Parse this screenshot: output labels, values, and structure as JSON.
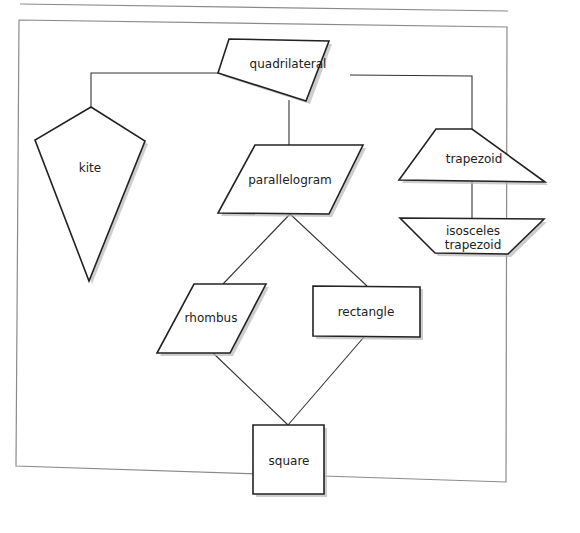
{
  "diagram": {
    "type": "hierarchy",
    "title": "",
    "nodes": [
      {
        "id": "quadrilateral",
        "label": "quadrilateral",
        "shape": "irregular-quadrilateral"
      },
      {
        "id": "kite",
        "label": "kite",
        "shape": "kite"
      },
      {
        "id": "parallelogram",
        "label": "parallelogram",
        "shape": "parallelogram"
      },
      {
        "id": "trapezoid",
        "label": "trapezoid",
        "shape": "trapezoid"
      },
      {
        "id": "isosceles_trapezoid",
        "label_line1": "isosceles",
        "label_line2": "trapezoid",
        "shape": "inverted-trapezoid"
      },
      {
        "id": "rhombus",
        "label": "rhombus",
        "shape": "rhombus"
      },
      {
        "id": "rectangle",
        "label": "rectangle",
        "shape": "rectangle"
      },
      {
        "id": "square",
        "label": "square",
        "shape": "square"
      }
    ],
    "edges": [
      {
        "from": "quadrilateral",
        "to": "kite"
      },
      {
        "from": "quadrilateral",
        "to": "parallelogram"
      },
      {
        "from": "quadrilateral",
        "to": "trapezoid"
      },
      {
        "from": "trapezoid",
        "to": "isosceles_trapezoid"
      },
      {
        "from": "parallelogram",
        "to": "rhombus"
      },
      {
        "from": "parallelogram",
        "to": "rectangle"
      },
      {
        "from": "rhombus",
        "to": "square"
      },
      {
        "from": "rectangle",
        "to": "square"
      }
    ]
  },
  "labels": {
    "quadrilateral": "quadrilateral",
    "kite": "kite",
    "parallelogram": "parallelogram",
    "trapezoid": "trapezoid",
    "isosceles_line1": "isosceles",
    "isosceles_line2": "trapezoid",
    "rhombus": "rhombus",
    "rectangle": "rectangle",
    "square": "square"
  },
  "colors": {
    "stroke": "#222222",
    "frame": "#8a8a8a",
    "shadow": "#b8b8b8",
    "background": "#ffffff"
  }
}
